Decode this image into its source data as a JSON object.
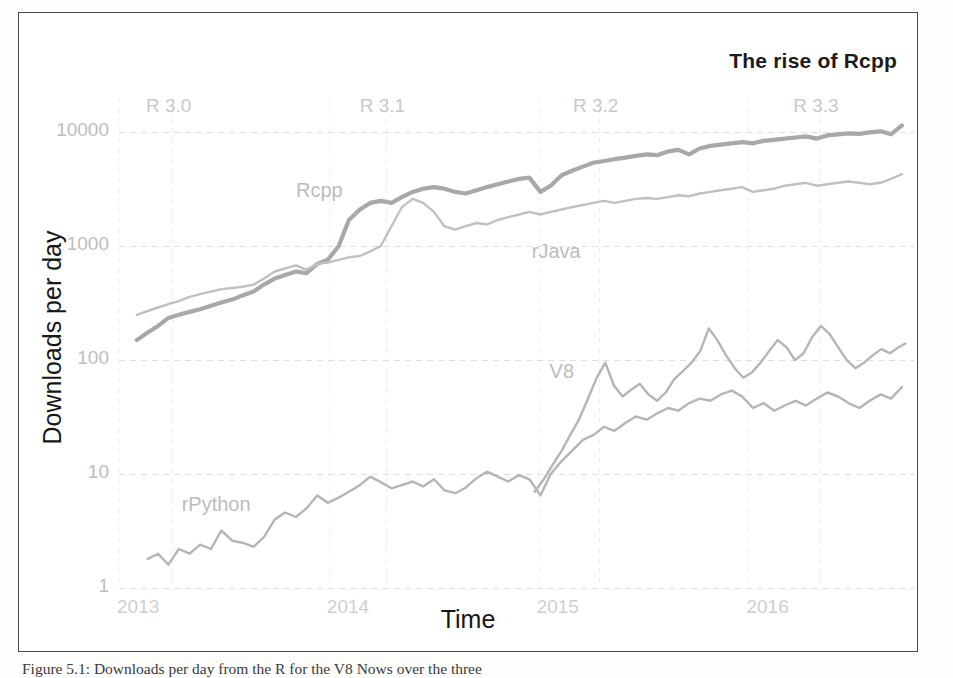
{
  "figure": {
    "title": "The rise of Rcpp",
    "caption": "Figure 5.1: Downloads per day from the R for the V8 Nows over the three"
  },
  "chart_data": {
    "type": "line",
    "title": "The rise of Rcpp",
    "xlabel": "Time",
    "ylabel": "Downloads per day",
    "yscale": "log",
    "ylim": [
      1,
      20000
    ],
    "xlim": [
      "2013-01-01",
      "2016-10-15"
    ],
    "grid": true,
    "legend_position": "inline-labels",
    "ytick_labels": [
      "1",
      "10",
      "100",
      "1000",
      "10000"
    ],
    "ytick_values": [
      1,
      10,
      100,
      1000,
      10000
    ],
    "xtick_labels": [
      "2013",
      "2014",
      "2015",
      "2016"
    ],
    "xtick_values": [
      "2013-01-01",
      "2014-01-01",
      "2015-01-01",
      "2016-01-01"
    ],
    "annotations": [
      {
        "label": "R 3.0",
        "x": "2013-04-03"
      },
      {
        "label": "R 3.1",
        "x": "2014-04-10"
      },
      {
        "label": "R 3.2",
        "x": "2015-04-16"
      },
      {
        "label": "R 3.3",
        "x": "2016-05-03"
      }
    ],
    "series": [
      {
        "name": "Rcpp",
        "color": "#a8a8a8",
        "width": 4.2,
        "label_x": "2013-11-05",
        "label_y": 3100,
        "x": [
          "2013-02-01",
          "2013-02-20",
          "2013-03-10",
          "2013-03-28",
          "2013-04-15",
          "2013-05-04",
          "2013-05-22",
          "2013-06-10",
          "2013-06-28",
          "2013-07-17",
          "2013-08-04",
          "2013-08-23",
          "2013-09-10",
          "2013-09-29",
          "2013-10-17",
          "2013-11-05",
          "2013-11-23",
          "2013-12-12",
          "2013-12-30",
          "2014-01-18",
          "2014-02-05",
          "2014-02-24",
          "2014-03-14",
          "2014-04-01",
          "2014-04-20",
          "2014-05-08",
          "2014-05-27",
          "2014-06-14",
          "2014-07-03",
          "2014-07-21",
          "2014-08-09",
          "2014-08-27",
          "2014-09-15",
          "2014-10-03",
          "2014-10-22",
          "2014-11-09",
          "2014-11-28",
          "2014-12-16",
          "2015-01-04",
          "2015-01-22",
          "2015-02-10",
          "2015-02-28",
          "2015-03-19",
          "2015-04-06",
          "2015-04-25",
          "2015-05-13",
          "2015-06-01",
          "2015-06-19",
          "2015-07-08",
          "2015-07-26",
          "2015-08-14",
          "2015-09-01",
          "2015-09-20",
          "2015-10-08",
          "2015-10-27",
          "2015-11-14",
          "2015-12-03",
          "2015-12-21",
          "2016-01-09",
          "2016-01-27",
          "2016-02-15",
          "2016-03-04",
          "2016-03-23",
          "2016-04-10",
          "2016-04-29",
          "2016-05-17",
          "2016-06-05",
          "2016-06-23",
          "2016-07-12",
          "2016-07-30",
          "2016-08-18",
          "2016-09-05",
          "2016-09-24"
        ],
        "y": [
          150,
          175,
          200,
          235,
          250,
          265,
          280,
          300,
          320,
          340,
          370,
          400,
          460,
          520,
          560,
          600,
          580,
          700,
          760,
          1000,
          1700,
          2100,
          2400,
          2500,
          2400,
          2700,
          3000,
          3200,
          3300,
          3200,
          3000,
          2900,
          3100,
          3300,
          3500,
          3700,
          3900,
          4000,
          3000,
          3400,
          4200,
          4600,
          5000,
          5400,
          5600,
          5800,
          6000,
          6200,
          6400,
          6300,
          6800,
          7000,
          6400,
          7200,
          7600,
          7800,
          8000,
          8200,
          8000,
          8400,
          8600,
          8800,
          9000,
          9200,
          8800,
          9400,
          9600,
          9800,
          9700,
          10000,
          10200,
          9600,
          11500
        ]
      },
      {
        "name": "rJava",
        "color": "#c0c0c0",
        "width": 2.4,
        "label_x": "2014-12-20",
        "label_y": 900,
        "x": [
          "2013-02-01",
          "2013-02-20",
          "2013-03-10",
          "2013-03-28",
          "2013-04-15",
          "2013-05-04",
          "2013-05-22",
          "2013-06-10",
          "2013-06-28",
          "2013-07-17",
          "2013-08-04",
          "2013-08-23",
          "2013-09-10",
          "2013-09-29",
          "2013-10-17",
          "2013-11-05",
          "2013-11-23",
          "2013-12-12",
          "2013-12-30",
          "2014-01-18",
          "2014-02-05",
          "2014-02-24",
          "2014-03-14",
          "2014-04-01",
          "2014-04-20",
          "2014-05-08",
          "2014-05-27",
          "2014-06-14",
          "2014-07-03",
          "2014-07-21",
          "2014-08-09",
          "2014-08-27",
          "2014-09-15",
          "2014-10-03",
          "2014-10-22",
          "2014-11-09",
          "2014-11-28",
          "2014-12-16",
          "2015-01-04",
          "2015-01-22",
          "2015-02-10",
          "2015-02-28",
          "2015-03-19",
          "2015-04-06",
          "2015-04-25",
          "2015-05-13",
          "2015-06-01",
          "2015-06-19",
          "2015-07-08",
          "2015-07-26",
          "2015-08-14",
          "2015-09-01",
          "2015-09-20",
          "2015-10-08",
          "2015-10-27",
          "2015-11-14",
          "2015-12-03",
          "2015-12-21",
          "2016-01-09",
          "2016-01-27",
          "2016-02-15",
          "2016-03-04",
          "2016-03-23",
          "2016-04-10",
          "2016-04-29",
          "2016-05-17",
          "2016-06-05",
          "2016-06-23",
          "2016-07-12",
          "2016-07-30",
          "2016-08-18",
          "2016-09-05",
          "2016-09-24"
        ],
        "y": [
          250,
          270,
          290,
          310,
          330,
          360,
          380,
          400,
          420,
          430,
          440,
          460,
          520,
          600,
          640,
          680,
          620,
          700,
          720,
          760,
          800,
          820,
          900,
          1000,
          1500,
          2200,
          2600,
          2400,
          2000,
          1500,
          1400,
          1500,
          1600,
          1550,
          1700,
          1800,
          1900,
          2000,
          1900,
          2000,
          2100,
          2200,
          2300,
          2400,
          2500,
          2400,
          2500,
          2600,
          2650,
          2600,
          2700,
          2800,
          2750,
          2900,
          3000,
          3100,
          3200,
          3300,
          3000,
          3100,
          3200,
          3400,
          3500,
          3600,
          3400,
          3500,
          3600,
          3700,
          3600,
          3500,
          3600,
          3900,
          4300
        ]
      },
      {
        "name": "V8",
        "color": "#b5b5b5",
        "width": 2.4,
        "label_x": "2015-01-20",
        "label_y": 80,
        "x": [
          "2014-12-25",
          "2015-01-10",
          "2015-01-25",
          "2015-02-10",
          "2015-02-25",
          "2015-03-12",
          "2015-03-27",
          "2015-04-12",
          "2015-04-27",
          "2015-05-12",
          "2015-05-27",
          "2015-06-11",
          "2015-06-26",
          "2015-07-11",
          "2015-07-26",
          "2015-08-10",
          "2015-08-25",
          "2015-09-09",
          "2015-09-24",
          "2015-10-09",
          "2015-10-24",
          "2015-11-08",
          "2015-11-23",
          "2015-12-08",
          "2015-12-23",
          "2016-01-07",
          "2016-01-22",
          "2016-02-06",
          "2016-02-21",
          "2016-03-07",
          "2016-03-22",
          "2016-04-06",
          "2016-04-21",
          "2016-05-06",
          "2016-05-21",
          "2016-06-05",
          "2016-06-20",
          "2016-07-05",
          "2016-07-20",
          "2016-08-04",
          "2016-08-19",
          "2016-09-03",
          "2016-09-18",
          "2016-09-30"
        ],
        "y": [
          7,
          9,
          12,
          16,
          22,
          30,
          45,
          70,
          95,
          60,
          48,
          55,
          62,
          50,
          44,
          52,
          68,
          80,
          95,
          120,
          190,
          150,
          110,
          85,
          70,
          78,
          95,
          120,
          150,
          130,
          100,
          115,
          160,
          200,
          170,
          130,
          100,
          85,
          95,
          110,
          125,
          115,
          130,
          140
        ]
      },
      {
        "name": "rPython",
        "color": "#b5b5b5",
        "width": 2.4,
        "label_x": "2013-04-20",
        "label_y": 5.5,
        "x": [
          "2013-02-20",
          "2013-03-10",
          "2013-03-28",
          "2013-04-15",
          "2013-05-04",
          "2013-05-22",
          "2013-06-10",
          "2013-06-28",
          "2013-07-17",
          "2013-08-04",
          "2013-08-23",
          "2013-09-10",
          "2013-09-29",
          "2013-10-17",
          "2013-11-05",
          "2013-11-23",
          "2013-12-12",
          "2013-12-30",
          "2014-01-18",
          "2014-02-05",
          "2014-02-24",
          "2014-03-14",
          "2014-04-01",
          "2014-04-20",
          "2014-05-08",
          "2014-05-27",
          "2014-06-14",
          "2014-07-03",
          "2014-07-21",
          "2014-08-09",
          "2014-08-27",
          "2014-09-15",
          "2014-10-03",
          "2014-10-22",
          "2014-11-09",
          "2014-11-28",
          "2014-12-16",
          "2015-01-04",
          "2015-01-22",
          "2015-02-10",
          "2015-02-28",
          "2015-03-19",
          "2015-04-06",
          "2015-04-25",
          "2015-05-13",
          "2015-06-01",
          "2015-06-19",
          "2015-07-08",
          "2015-07-26",
          "2015-08-14",
          "2015-09-01",
          "2015-09-20",
          "2015-10-08",
          "2015-10-27",
          "2015-11-14",
          "2015-12-03",
          "2015-12-21",
          "2016-01-09",
          "2016-01-27",
          "2016-02-15",
          "2016-03-04",
          "2016-03-23",
          "2016-04-10",
          "2016-04-29",
          "2016-05-17",
          "2016-06-05",
          "2016-06-23",
          "2016-07-12",
          "2016-07-30",
          "2016-08-18",
          "2016-09-05",
          "2016-09-24"
        ],
        "y": [
          1.8,
          2.0,
          1.6,
          2.2,
          2.0,
          2.4,
          2.2,
          3.2,
          2.6,
          2.5,
          2.3,
          2.8,
          4.0,
          4.6,
          4.2,
          5.0,
          6.5,
          5.6,
          6.2,
          7.0,
          8.0,
          9.5,
          8.5,
          7.5,
          8.0,
          8.6,
          7.8,
          9.0,
          7.2,
          6.8,
          7.6,
          9.2,
          10.5,
          9.5,
          8.6,
          9.8,
          9.0,
          6.5,
          10,
          13,
          16,
          20,
          22,
          26,
          24,
          28,
          32,
          30,
          34,
          38,
          36,
          42,
          46,
          44,
          50,
          54,
          48,
          38,
          42,
          36,
          40,
          44,
          40,
          46,
          52,
          48,
          42,
          38,
          44,
          50,
          46,
          58
        ]
      }
    ]
  },
  "axis": {
    "yticks": [
      {
        "label": "10000",
        "value": 10000
      },
      {
        "label": "1000",
        "value": 1000
      },
      {
        "label": "100",
        "value": 100
      },
      {
        "label": "10",
        "value": 10
      },
      {
        "label": "1",
        "value": 1
      }
    ],
    "xticks": [
      {
        "label": "2013"
      },
      {
        "label": "2014"
      },
      {
        "label": "2015"
      },
      {
        "label": "2016"
      }
    ],
    "xlabel": "Time",
    "ylabel": "Downloads per day"
  },
  "version_markers": [
    {
      "label": "R 3.0"
    },
    {
      "label": "R 3.1"
    },
    {
      "label": "R 3.2"
    },
    {
      "label": "R 3.3"
    }
  ],
  "series_labels": [
    {
      "label": "Rcpp"
    },
    {
      "label": "rJava"
    },
    {
      "label": "V8"
    },
    {
      "label": "rPython"
    }
  ],
  "colors": {
    "rcpp": "#a8a8a8",
    "rjava": "#c0c0c0",
    "v8": "#b5b5b5",
    "rpython": "#b5b5b5",
    "frame": "#4b4b4b",
    "text_dark": "#161616",
    "text_faint": "#c2c2c2"
  }
}
